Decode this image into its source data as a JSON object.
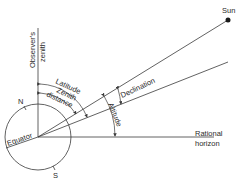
{
  "diagram": {
    "type": "celestial-geometry",
    "colors": {
      "line": "#3a3a3a",
      "text": "#2a2a2a",
      "background": "#ffffff"
    },
    "labels": {
      "sun": "Sun",
      "observers_zenith_line1": "Observer's",
      "observers_zenith_line2": "zenith",
      "latitude": "Latitude",
      "zenith_distance_line1": "Zenith",
      "zenith_distance_line2": "distance",
      "declination": "Declination",
      "altitude": "Altitude",
      "rational_horizon_line1": "Rational",
      "rational_horizon_line2": "horizon",
      "equator": "Equator",
      "north": "N",
      "south": "S"
    }
  }
}
